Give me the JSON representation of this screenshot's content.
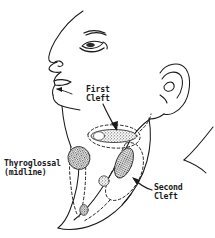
{
  "figure": {
    "type": "anatomical-line-drawing",
    "view": "left lateral profile",
    "background_color": "#ffffff",
    "ink_color": "#1a1a1a"
  },
  "labels": {
    "first_cleft": {
      "line1": "First",
      "line2": "Cleft",
      "full": "First Cleft",
      "pointer": "arrow pointing down-right to preauricular/parotid region lesion"
    },
    "thyroglossal": {
      "line1": "Thyroglossal",
      "line2": "(midline)",
      "full": "Thyroglossal (midline)",
      "pointer": "none"
    },
    "second_cleft": {
      "line1": "Second",
      "line2": "Cleft",
      "full": "Second Cleft",
      "pointer": "arrow pointing up-left to anterior sternocleidomastoid border lesion"
    }
  },
  "anatomy_parts": [
    {
      "name": "forehead-and-nose-profile"
    },
    {
      "name": "eye"
    },
    {
      "name": "eyebrow"
    },
    {
      "name": "nostril"
    },
    {
      "name": "lips"
    },
    {
      "name": "chin"
    },
    {
      "name": "ear"
    },
    {
      "name": "jawline"
    },
    {
      "name": "neck-anterior-border"
    },
    {
      "name": "sternocleidomastoid"
    },
    {
      "name": "shoulder-line"
    }
  ],
  "lesions": [
    {
      "name": "first-cleft-cyst",
      "shape": "horizontal elongated oval",
      "fill": "stippled",
      "outline": "dashed"
    },
    {
      "name": "thyroglossal-duct-cyst",
      "shape": "round blob",
      "fill": "stippled",
      "outline": "dashed tract"
    },
    {
      "name": "second-cleft-cyst",
      "shape": "diagonal elongated oval",
      "fill": "stippled",
      "outline": "dashed"
    },
    {
      "name": "accessory-nodule-upper",
      "shape": "small circle",
      "fill": "stippled"
    },
    {
      "name": "accessory-nodule-lower",
      "shape": "small circle",
      "fill": "stippled"
    }
  ]
}
